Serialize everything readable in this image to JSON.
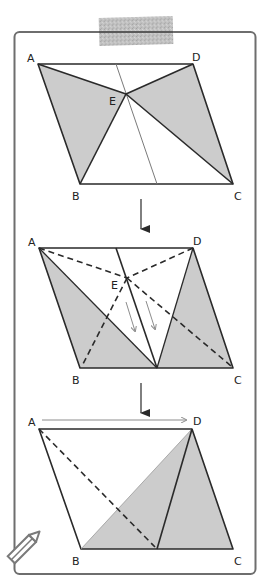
{
  "figure": {
    "colors": {
      "frame": "#6e6e6e",
      "line": "#2a2a2a",
      "shade": "#cccccc",
      "thin": "#8c8c8c",
      "tape": "#b5b5b5"
    },
    "panels": [
      {
        "step": 1,
        "labels": {
          "A": "A",
          "B": "B",
          "C": "C",
          "D": "D",
          "E": "E"
        },
        "description": "Parallelogram ABCD with point E; shaded triangles ABE and DEC; thin line through E"
      },
      {
        "step": 2,
        "labels": {
          "A": "A",
          "B": "B",
          "C": "C",
          "D": "D",
          "E": "E"
        },
        "description": "E slides along the line down to BC; dashed old segments AE, EB, DE, EC; shaded triangles move"
      },
      {
        "step": 3,
        "labels": {
          "A": "A",
          "B": "B",
          "C": "C",
          "D": "D"
        },
        "description": "A slides toward D; shaded triangle BCD equals half the parallelogram"
      }
    ],
    "arrows": [
      "down-arrow-1",
      "down-arrow-2"
    ],
    "decorations": [
      "tape",
      "pencil-icon"
    ]
  }
}
